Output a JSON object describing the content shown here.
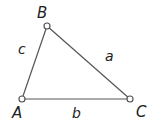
{
  "diagram": {
    "type": "triangle",
    "stroke_color": "#555555",
    "vertices": [
      {
        "label": "A",
        "x": 22,
        "y": 99,
        "label_x": 12,
        "label_y": 118
      },
      {
        "label": "B",
        "x": 47,
        "y": 26,
        "label_x": 37,
        "label_y": 18
      },
      {
        "label": "C",
        "x": 130,
        "y": 99,
        "label_x": 136,
        "label_y": 117
      }
    ],
    "sides": [
      {
        "label": "a",
        "between": [
          "B",
          "C"
        ],
        "label_x": 105,
        "label_y": 61
      },
      {
        "label": "b",
        "between": [
          "A",
          "C"
        ],
        "label_x": 72,
        "label_y": 118
      },
      {
        "label": "c",
        "between": [
          "A",
          "B"
        ],
        "label_x": 18,
        "label_y": 54
      }
    ]
  }
}
